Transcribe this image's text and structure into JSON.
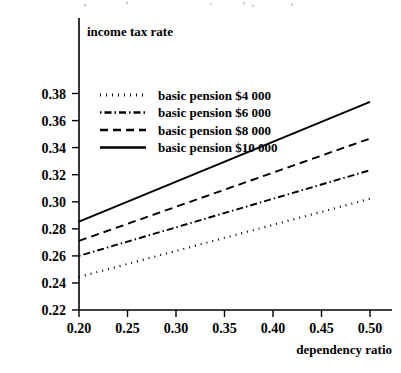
{
  "chart_data": {
    "type": "line",
    "title": "",
    "xlabel": "dependency ratio",
    "ylabel": "income tax rate",
    "xlim": [
      0.2,
      0.5
    ],
    "ylim": [
      0.22,
      0.38
    ],
    "grid": false,
    "legend_position": "upper-left-inside",
    "xticks": [
      "0.20",
      "0.25",
      "0.30",
      "0.35",
      "0.40",
      "0.45",
      "0.50"
    ],
    "xtick_values": [
      0.2,
      0.25,
      0.3,
      0.35,
      0.4,
      0.45,
      0.5
    ],
    "yticks": [
      "0.22",
      "0.24",
      "0.26",
      "0.28",
      "0.30",
      "0.32",
      "0.34",
      "0.36",
      "0.38"
    ],
    "ytick_values": [
      0.22,
      0.24,
      0.26,
      0.28,
      0.3,
      0.32,
      0.34,
      0.36,
      0.38
    ],
    "x": [
      0.2,
      0.5
    ],
    "series": [
      {
        "name": "basic pension $4 000",
        "style": "dotted",
        "dash": "1,5",
        "width": 2.2,
        "values": [
          0.2444,
          0.3022
        ]
      },
      {
        "name": "basic pension $6 000",
        "style": "dash-dot",
        "dash": "1.5,3,7,3",
        "width": 1.9,
        "values": [
          0.26,
          0.3233
        ]
      },
      {
        "name": "basic pension $8 000",
        "style": "dashed",
        "dash": "8,5",
        "width": 1.9,
        "values": [
          0.2711,
          0.3467
        ]
      },
      {
        "name": "basic pension $10 000",
        "style": "solid",
        "dash": "",
        "width": 1.9,
        "values": [
          0.2853,
          0.3738
        ]
      }
    ]
  },
  "colors": {
    "axis": "#000000",
    "series": "#000000",
    "background": "#ffffff"
  }
}
